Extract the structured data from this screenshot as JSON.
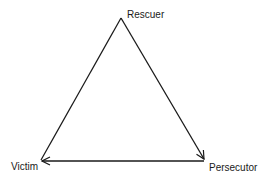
{
  "diagram": {
    "type": "triangle",
    "nodes": [
      {
        "id": "rescuer",
        "label": "Rescuer",
        "position": "top"
      },
      {
        "id": "victim",
        "label": "Victim",
        "position": "bottom-left"
      },
      {
        "id": "persecutor",
        "label": "Persecutor",
        "position": "bottom-right"
      }
    ],
    "edges": [
      {
        "from": "rescuer",
        "to": "persecutor",
        "arrow": "end"
      },
      {
        "from": "persecutor",
        "to": "victim",
        "arrow": "end"
      },
      {
        "from": "victim",
        "to": "rescuer",
        "arrow": "none"
      }
    ],
    "colors": {
      "line": "#1a1a1a",
      "background": "#ffffff"
    }
  }
}
